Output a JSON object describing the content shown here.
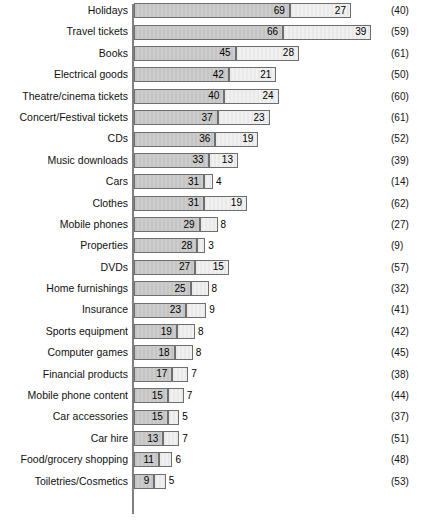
{
  "chart_data": {
    "type": "bar",
    "orientation": "horizontal",
    "stacked": true,
    "title": "",
    "subtitle": "",
    "xlabel": "",
    "ylabel": "",
    "grid": false,
    "legend_position": "none",
    "xlim": [
      0,
      110
    ],
    "px_per_unit": 2.26,
    "categories": [
      "Holidays",
      "Travel tickets",
      "Books",
      "Electrical goods",
      "Theatre/cinema tickets",
      "Concert/Festival tickets",
      "CDs",
      "Music downloads",
      "Cars",
      "Clothes",
      "Mobile phones",
      "Properties",
      "DVDs",
      "Home furnishings",
      "Insurance",
      "Sports equipment",
      "Computer games",
      "Financial products",
      "Mobile phone content",
      "Car accessories",
      "Car hire",
      "Food/grocery shopping",
      "Toiletries/Cosmetics"
    ],
    "series": [
      {
        "name": "primary",
        "values": [
          69,
          66,
          45,
          42,
          40,
          37,
          36,
          33,
          31,
          31,
          29,
          28,
          27,
          25,
          23,
          19,
          18,
          17,
          15,
          15,
          13,
          11,
          9
        ]
      },
      {
        "name": "secondary",
        "values": [
          27,
          39,
          28,
          21,
          24,
          23,
          19,
          13,
          4,
          19,
          8,
          3,
          15,
          8,
          9,
          8,
          8,
          7,
          7,
          5,
          7,
          6,
          5
        ]
      }
    ],
    "base_counts": [
      "(40)",
      "(59)",
      "(61)",
      "(50)",
      "(60)",
      "(61)",
      "(52)",
      "(39)",
      "(14)",
      "(62)",
      "(27)",
      "(9)",
      "(57)",
      "(32)",
      "(41)",
      "(42)",
      "(45)",
      "(38)",
      "(44)",
      "(37)",
      "(51)",
      "(48)",
      "(53)"
    ],
    "rows": [
      {
        "label": "Holidays",
        "primary": 69,
        "secondary": 27,
        "base": "(40)"
      },
      {
        "label": "Travel tickets",
        "primary": 66,
        "secondary": 39,
        "base": "(59)"
      },
      {
        "label": "Books",
        "primary": 45,
        "secondary": 28,
        "base": "(61)"
      },
      {
        "label": "Electrical goods",
        "primary": 42,
        "secondary": 21,
        "base": "(50)"
      },
      {
        "label": "Theatre/cinema tickets",
        "primary": 40,
        "secondary": 24,
        "base": "(60)"
      },
      {
        "label": "Concert/Festival tickets",
        "primary": 37,
        "secondary": 23,
        "base": "(61)"
      },
      {
        "label": "CDs",
        "primary": 36,
        "secondary": 19,
        "base": "(52)"
      },
      {
        "label": "Music downloads",
        "primary": 33,
        "secondary": 13,
        "base": "(39)"
      },
      {
        "label": "Cars",
        "primary": 31,
        "secondary": 4,
        "base": "(14)"
      },
      {
        "label": "Clothes",
        "primary": 31,
        "secondary": 19,
        "base": "(62)"
      },
      {
        "label": "Mobile phones",
        "primary": 29,
        "secondary": 8,
        "base": "(27)"
      },
      {
        "label": "Properties",
        "primary": 28,
        "secondary": 3,
        "base": "(9)"
      },
      {
        "label": "DVDs",
        "primary": 27,
        "secondary": 15,
        "base": "(57)"
      },
      {
        "label": "Home furnishings",
        "primary": 25,
        "secondary": 8,
        "base": "(32)"
      },
      {
        "label": "Insurance",
        "primary": 23,
        "secondary": 9,
        "base": "(41)"
      },
      {
        "label": "Sports equipment",
        "primary": 19,
        "secondary": 8,
        "base": "(42)"
      },
      {
        "label": "Computer games",
        "primary": 18,
        "secondary": 8,
        "base": "(45)"
      },
      {
        "label": "Financial products",
        "primary": 17,
        "secondary": 7,
        "base": "(38)"
      },
      {
        "label": "Mobile phone content",
        "primary": 15,
        "secondary": 7,
        "base": "(44)"
      },
      {
        "label": "Car accessories",
        "primary": 15,
        "secondary": 5,
        "base": "(37)"
      },
      {
        "label": "Car hire",
        "primary": 13,
        "secondary": 7,
        "base": "(51)"
      },
      {
        "label": "Food/grocery shopping",
        "primary": 11,
        "secondary": 6,
        "base": "(48)"
      },
      {
        "label": "Toiletries/Cosmetics",
        "primary": 9,
        "secondary": 5,
        "base": "(53)"
      }
    ]
  },
  "colors": {
    "primary_fill": "#c9c9c9",
    "secondary_fill": "#ededed",
    "bar_outline": "#6e6e6e",
    "axis": "#808080",
    "text": "#111111",
    "background": "#ffffff"
  }
}
